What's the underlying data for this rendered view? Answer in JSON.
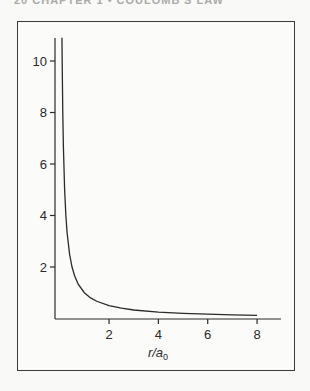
{
  "page": {
    "running_head": "20 CHAPTER 1 • COULOMB'S LAW"
  },
  "chart_data": {
    "type": "line",
    "title": "",
    "xlabel": "r/a0",
    "xlabel_main": "r/a",
    "xlabel_sub": "0",
    "ylabel": "",
    "xlim": [
      0,
      9
    ],
    "ylim": [
      0,
      11
    ],
    "x_ticks": [
      2,
      4,
      6,
      8
    ],
    "y_ticks": [
      2,
      4,
      6,
      8,
      10
    ],
    "x_tick_labels": [
      "2",
      "4",
      "6",
      "8"
    ],
    "y_tick_labels": [
      "2",
      "4",
      "6",
      "8",
      "10"
    ],
    "grid": false,
    "legend": null,
    "series": [
      {
        "name": "1/(r/a0)",
        "x": [
          0.092,
          0.1,
          0.125,
          0.15,
          0.2,
          0.25,
          0.3,
          0.4,
          0.5,
          0.6,
          0.75,
          1.0,
          1.25,
          1.5,
          2.0,
          2.5,
          3.0,
          4.0,
          5.0,
          6.0,
          7.0,
          8.0
        ],
        "values": [
          10.9,
          10.0,
          8.0,
          6.67,
          5.0,
          4.0,
          3.33,
          2.5,
          2.0,
          1.67,
          1.33,
          1.0,
          0.8,
          0.67,
          0.5,
          0.4,
          0.33,
          0.25,
          0.2,
          0.17,
          0.14,
          0.125
        ]
      }
    ]
  }
}
